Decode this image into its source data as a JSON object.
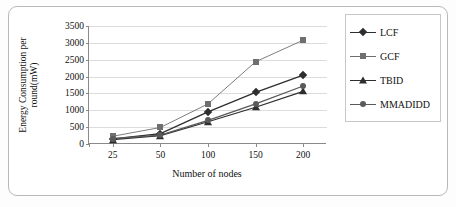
{
  "chart_data": {
    "type": "line",
    "title": "",
    "xlabel": "Number of nodes",
    "ylabel": "Energy Consumption per round(mW)",
    "categories": [
      "25",
      "50",
      "100",
      "150",
      "200"
    ],
    "ylim": [
      0,
      3500
    ],
    "yticks": [
      "0",
      "500",
      "1000",
      "1500",
      "2000",
      "2500",
      "3000",
      "3500"
    ],
    "grid": true,
    "legend_position": "right",
    "series": [
      {
        "name": "LCF",
        "marker": "diamond",
        "color": "#2e2e2e",
        "values": [
          150,
          310,
          950,
          1530,
          2040
        ]
      },
      {
        "name": "GCF",
        "marker": "square",
        "color": "#6f6f6f",
        "values": [
          230,
          490,
          1190,
          2440,
          3080
        ]
      },
      {
        "name": "TBID",
        "marker": "triangle",
        "color": "#2e2e2e",
        "values": [
          130,
          250,
          660,
          1090,
          1560
        ]
      },
      {
        "name": "MMADIDD",
        "marker": "circle",
        "color": "#5a5a5a",
        "values": [
          160,
          265,
          700,
          1190,
          1720
        ]
      }
    ]
  }
}
